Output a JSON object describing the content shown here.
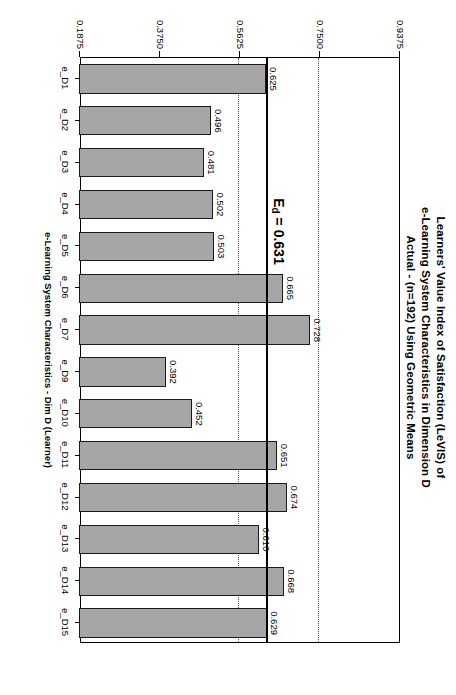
{
  "chart_data": {
    "type": "bar",
    "orientation": "vertical-rotated",
    "title": "Learners' Value Index of Satisfaction (LeVIS) of\ne-Learning System Characteristics in Dimension D\nActual - (n=192) Using Geometric Means",
    "xlabel": "e-Learning System Characteristics - Dim D (Learner)",
    "ylabel": "LeVIS",
    "categories": [
      "e_D1",
      "e_D2",
      "e_D3",
      "e_D4",
      "e_D5",
      "e_D6",
      "e_D7",
      "e_D9",
      "e_D10",
      "e_D11",
      "e_D12",
      "e_D13",
      "e_D14",
      "e_D15"
    ],
    "values": [
      0.625,
      0.496,
      0.481,
      0.502,
      0.503,
      0.665,
      0.728,
      0.392,
      0.452,
      0.651,
      0.674,
      0.61,
      0.668,
      0.629
    ],
    "value_labels": [
      "0.625",
      "0.496",
      "0.481",
      "0.502",
      "0.503",
      "0.665",
      "0.728",
      "0.392",
      "0.452",
      "0.651",
      "0.674",
      "0.610",
      "0.668",
      "0.629"
    ],
    "ylim": [
      0.1875,
      0.9375
    ],
    "yticks": [
      0.1875,
      0.375,
      0.5625,
      0.75,
      0.9375
    ],
    "ytick_labels": [
      "0.1875",
      "0.3750",
      "0.5625",
      "0.7500",
      "0.9375"
    ],
    "gridlines": [
      0.5625,
      0.75
    ],
    "grid": "dotted-major-partial",
    "legend": "none",
    "reference_line": {
      "value": 0.631,
      "label_prefix": "E",
      "label_subscript": "d",
      "label_suffix": " = 0.631",
      "style": "solid-thick"
    },
    "colors": {
      "bar_fill": "#a6a6a6",
      "bar_border": "#1a1a1a",
      "axis": "#000000",
      "gridline": "#555555",
      "reference_line": "#000000",
      "background": "#ffffff"
    }
  }
}
